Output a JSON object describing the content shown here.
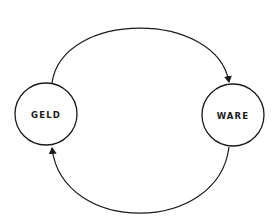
{
  "diagram": {
    "type": "cycle",
    "nodes": [
      {
        "id": "geld",
        "label": "GELD"
      },
      {
        "id": "ware",
        "label": "WARE"
      }
    ],
    "edges": [
      {
        "from": "geld",
        "to": "ware",
        "path": "upper-arc"
      },
      {
        "from": "ware",
        "to": "geld",
        "path": "lower-arc"
      }
    ],
    "colors": {
      "stroke": "#1a1a1a",
      "background": "#ffffff"
    }
  }
}
